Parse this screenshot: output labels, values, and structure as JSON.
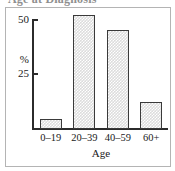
{
  "figure": {
    "truncated_title": "Age at Diagnosis",
    "frame_color": "#b4b4b4",
    "axis_color": "#2b2b2b",
    "bar_fill_color": "#dcdcdc",
    "bar_border_color": "#3a3a3a"
  },
  "chart_data": {
    "type": "bar",
    "title": "",
    "xlabel": "Age",
    "ylabel": "%",
    "categories": [
      "0–19",
      "20–39",
      "40–59",
      "60+"
    ],
    "values": [
      4,
      47,
      41,
      11
    ],
    "ylim": [
      0,
      50
    ],
    "ytick_labels": [
      "25",
      "50"
    ],
    "ytick_values": [
      25,
      50
    ],
    "grid": false,
    "legend": false
  }
}
